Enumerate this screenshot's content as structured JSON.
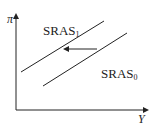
{
  "diagram": {
    "title": "",
    "y_axis_label": "π",
    "x_axis_label": "Y",
    "curves": [
      {
        "name": "SRAS",
        "subscript": "1"
      },
      {
        "name": "SRAS",
        "subscript": "0"
      }
    ],
    "arrow": {
      "direction": "left",
      "meaning": "shift from SRAS0 to SRAS1"
    }
  }
}
